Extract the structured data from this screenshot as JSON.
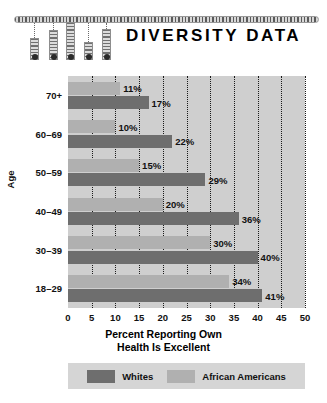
{
  "header": {
    "title": "DIVERSITY DATA",
    "decoration": {
      "name": "hanging-bars-graphic",
      "bars": [
        {
          "height": 22,
          "top": 22
        },
        {
          "height": 30,
          "top": 14
        },
        {
          "height": 38,
          "top": 6
        },
        {
          "height": 18,
          "top": 26
        },
        {
          "height": 31,
          "top": 13
        }
      ]
    }
  },
  "chart_data": {
    "type": "bar",
    "orientation": "horizontal",
    "title_lines": [
      "Percent Reporting Own",
      "Health Is Excellent"
    ],
    "xlabel": "",
    "ylabel": "Age",
    "categories": [
      "70+",
      "60–69",
      "50–59",
      "40–49",
      "30–39",
      "18–29"
    ],
    "series": [
      {
        "name": "Whites",
        "color": "#6e6e6e",
        "values": [
          17,
          22,
          29,
          36,
          40,
          41
        ],
        "labels": [
          "17%",
          "22%",
          "29%",
          "36%",
          "40%",
          "41%"
        ]
      },
      {
        "name": "African Americans",
        "color": "#b0b0b0",
        "values": [
          11,
          10,
          15,
          20,
          30,
          34
        ],
        "labels": [
          "11%",
          "10%",
          "15%",
          "20%",
          "30%",
          "34%"
        ]
      }
    ],
    "xlim": [
      0,
      50
    ],
    "xticks": [
      0,
      5,
      10,
      15,
      20,
      25,
      30,
      35,
      40,
      45,
      50
    ],
    "xtick_labels": [
      "0",
      "5",
      "10",
      "15",
      "20",
      "25",
      "30",
      "35",
      "40",
      "45",
      "50"
    ],
    "grid": true,
    "grid_style": "dotted-vertical",
    "legend_position": "bottom",
    "plot_background": "#cfcfcf"
  }
}
